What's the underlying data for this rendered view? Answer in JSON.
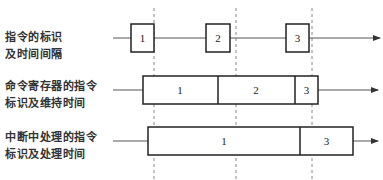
{
  "diagram": {
    "rows": [
      {
        "label_line1": "指令的标识",
        "label_line2": "及时间间隔",
        "segments": [
          "1",
          "2",
          "3"
        ]
      },
      {
        "label_line1": "命令寄存器的指令",
        "label_line2": "标识及维持时间",
        "segments": [
          "1",
          "2",
          "3"
        ]
      },
      {
        "label_line1": "中断中处理的指令",
        "label_line2": "标识及处理时间",
        "segments": [
          "1",
          "3"
        ]
      }
    ],
    "dashed_guides": 3
  }
}
